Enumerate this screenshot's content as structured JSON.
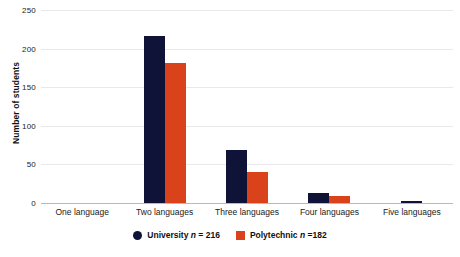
{
  "chart_data": {
    "type": "bar",
    "title": "",
    "xlabel": "",
    "ylabel": "Number of students",
    "ylim": [
      0,
      250
    ],
    "yticks": [
      0,
      50,
      100,
      150,
      200,
      250
    ],
    "grid": true,
    "legend_position": "bottom-center",
    "categories": [
      "One language",
      "Two languages",
      "Three languages",
      "Four languages",
      "Five languages"
    ],
    "series": [
      {
        "name": "University",
        "legend_label": "University n = 216",
        "n": 216,
        "color": "#101338",
        "marker": "circle",
        "values": [
          0,
          216,
          69,
          13,
          3
        ]
      },
      {
        "name": "Polytechnic",
        "legend_label": "Polytechnic n =182",
        "n": 182,
        "color": "#d9421a",
        "marker": "square",
        "values": [
          0,
          182,
          40,
          9,
          0
        ]
      }
    ]
  },
  "axis": {
    "y_title": "Number of students",
    "y_tick_labels": [
      "0",
      "50",
      "100",
      "150",
      "200",
      "250"
    ]
  },
  "legend": {
    "items": [
      {
        "label_main": "University",
        "label_var": "n",
        "label_rest": "= 216",
        "full": "University n = 216",
        "marker": "legend-circle-navy"
      },
      {
        "label_main": "Polytechnic",
        "label_var": "n",
        "label_rest": "=182",
        "full": "Polytechnic n =182",
        "marker": "legend-square-orange"
      }
    ]
  },
  "colors": {
    "university": "#101338",
    "polytechnic": "#d9421a",
    "gridline": "#e9e9ec",
    "baseline": "#b9b9bd",
    "background": "#ffffff",
    "text": "#1a1a1a"
  }
}
